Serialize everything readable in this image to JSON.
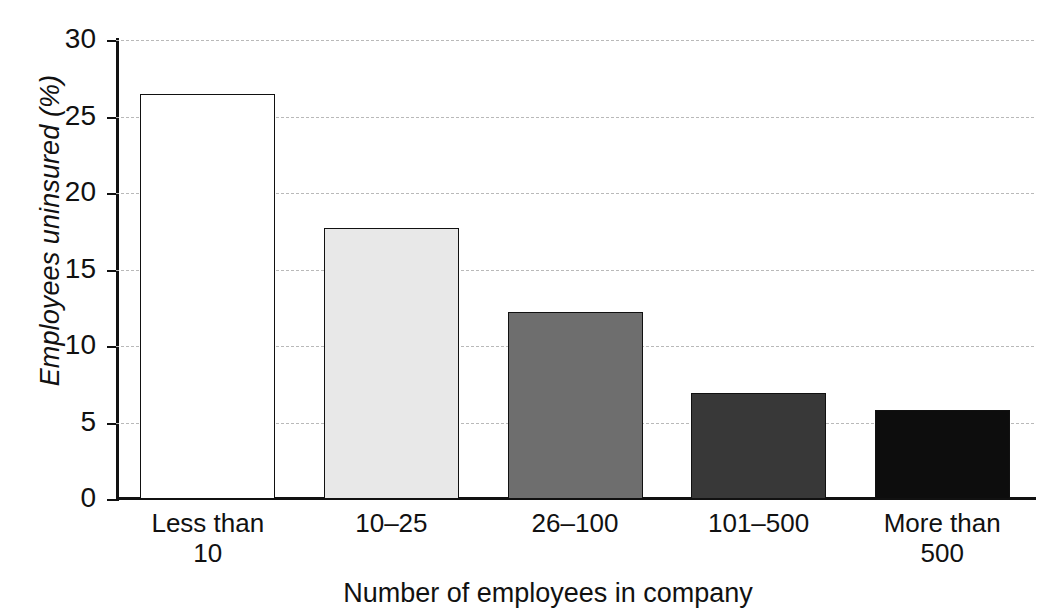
{
  "chart_data": {
    "type": "bar",
    "title": "",
    "xlabel": "Number of employees in company",
    "ylabel": "Employees uninsured (%)",
    "categories": [
      "Less than 10",
      "10–25",
      "26–100",
      "101–500",
      "More than 500"
    ],
    "category_lines": [
      [
        "Less than",
        "10"
      ],
      [
        "10–25"
      ],
      [
        "26–100"
      ],
      [
        "101–500"
      ],
      [
        "More than",
        "500"
      ]
    ],
    "values": [
      26.5,
      17.7,
      12.2,
      6.9,
      5.8
    ],
    "ylim": [
      0,
      30
    ],
    "ytick_labels": [
      "0",
      "5",
      "10",
      "15",
      "20",
      "25",
      "30"
    ],
    "ytick_values": [
      0,
      5,
      10,
      15,
      20,
      25,
      30
    ],
    "grid": true,
    "grid_style": "dashed",
    "grid_color": "#b9b9b9",
    "legend": "none",
    "bar_colors": [
      "#ffffff",
      "#e8e8e8",
      "#6e6e6e",
      "#383838",
      "#0d0d0d"
    ],
    "bar_edge_color": "#111111",
    "axis_color": "#111111"
  }
}
